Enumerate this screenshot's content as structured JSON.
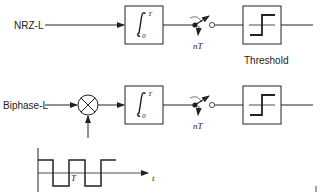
{
  "rows": [
    {
      "input_label": "NRZ-L",
      "integrator": {
        "upper_limit": "T",
        "lower_limit": "0",
        "symbol": "∫"
      },
      "sampler_label": "nT",
      "threshold_label": "Threshold"
    },
    {
      "input_label": "Biphase-L",
      "multiplier_symbol": "⊗",
      "integrator": {
        "upper_limit": "T",
        "lower_limit": "0",
        "symbol": "∫"
      },
      "sampler_label": "nT"
    }
  ],
  "reference_waveform": {
    "period_label": "T",
    "time_axis_label": "t"
  },
  "colors": {
    "stroke": "#222222",
    "background": "#ffffff"
  }
}
